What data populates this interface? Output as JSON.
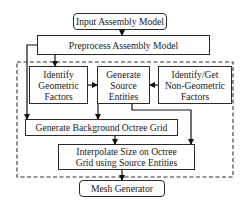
{
  "diagram": {
    "type": "flowchart",
    "nodes": {
      "input": {
        "label": "Input Assembly Model"
      },
      "preprocess": {
        "label": "Preprocess Assembly Model"
      },
      "geometric": {
        "line1": "Identify",
        "line2": "Geometric",
        "line3": "Factors"
      },
      "source": {
        "line1": "Generate",
        "line2": "Source",
        "line3": "Entities"
      },
      "nongeometric": {
        "line1": "Identify/Get",
        "line2": "Non-Geometric",
        "line3": "Factors"
      },
      "octree": {
        "label": "Generate Background Octree Grid"
      },
      "interpolate": {
        "line1": "Interpolate Size on Octree",
        "line2": "Grid using Source Entities"
      },
      "mesh": {
        "label": "Mesh Generator"
      }
    },
    "edges": [
      [
        "Input Assembly Model",
        "Preprocess Assembly Model"
      ],
      [
        "Preprocess Assembly Model",
        "Identify Geometric Factors"
      ],
      [
        "Preprocess Assembly Model",
        "Generate Background Octree Grid"
      ],
      [
        "Identify Geometric Factors",
        "Generate Source Entities"
      ],
      [
        "Identify/Get Non-Geometric Factors",
        "Generate Source Entities"
      ],
      [
        "Generate Source Entities",
        "Generate Background Octree Grid"
      ],
      [
        "Generate Source Entities",
        "Interpolate Size on Octree Grid using Source Entities"
      ],
      [
        "Generate Background Octree Grid",
        "Interpolate Size on Octree Grid using Source Entities"
      ],
      [
        "Interpolate Size on Octree Grid using Source Entities",
        "Mesh Generator"
      ]
    ],
    "group": {
      "style": "dashed",
      "contains": [
        "geometric",
        "source",
        "nongeometric",
        "octree",
        "interpolate"
      ]
    }
  }
}
